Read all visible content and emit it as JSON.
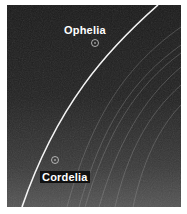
{
  "image": {
    "subject": "Uranus epsilon ring with shepherd moons",
    "labels": [
      {
        "name": "Ophelia"
      },
      {
        "name": "Cordelia"
      }
    ],
    "colors": {
      "background": "#1e1e1e",
      "ring": "#f2f2f2",
      "faint_rings": "#8a8a8a",
      "label_text": "#ffffff"
    }
  }
}
